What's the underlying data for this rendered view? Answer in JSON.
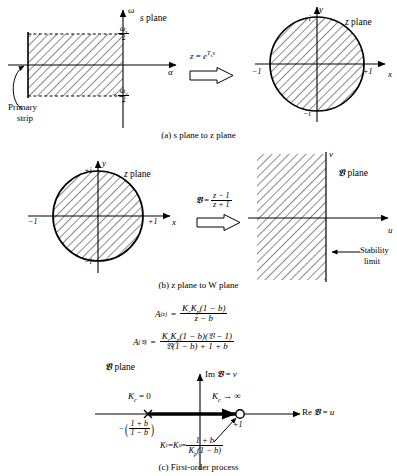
{
  "figure": {
    "captions": {
      "a": "(a)  s plane to z plane",
      "b": "(b)  z plane to W plane",
      "c": "(c)  First-order process"
    }
  },
  "panel_a": {
    "s_plane": {
      "plane_label": "s plane",
      "axis_vertical": "ω",
      "axis_horizontal": "α",
      "tick_upper_num": "ω",
      "tick_upper_sub": "s",
      "tick_upper_den": "2",
      "tick_lower_sign": "−",
      "tick_lower_num": "ω",
      "tick_lower_sub": "s",
      "tick_lower_den": "2",
      "annotation_line1": "Primary",
      "annotation_line2": "strip"
    },
    "transform": {
      "lhs": "z",
      "eq": "=",
      "base": "e",
      "exp_sub": "T",
      "exp_sub2": "s",
      "exp_var": "s"
    },
    "z_plane": {
      "plane_label": "z plane",
      "axis_vertical": "y",
      "axis_horizontal": "x",
      "tick_top": "+i",
      "tick_bottom": "−i",
      "tick_left": "−1",
      "tick_right": "+1"
    }
  },
  "panel_b": {
    "z_plane": {
      "plane_label": "z plane",
      "axis_vertical": "y",
      "axis_horizontal": "x",
      "tick_top": "+i",
      "tick_bottom": "−i",
      "tick_left": "−1",
      "tick_right": "+1"
    },
    "transform": {
      "lhs": "𝔙",
      "eq": "=",
      "num": "z − 1",
      "den": "z + 1"
    },
    "w_plane": {
      "plane_label": "𝔙 plane",
      "axis_vertical": "v",
      "axis_horizontal": "u",
      "stability_line1": "Stability",
      "stability_line2": "limit"
    }
  },
  "equations": {
    "eq1": {
      "lhs_var": "A",
      "lhs_sub": "(z)",
      "eq": "=",
      "num_k1": "K",
      "num_k1_sub": "c",
      "num_k2": "K",
      "num_k2_sub": "p",
      "num_rest": "(1 − b)",
      "den": "z − b"
    },
    "eq2": {
      "lhs_var": "A",
      "lhs_sub": "(𝔙)",
      "eq": "=",
      "num_k1": "K",
      "num_k1_sub": "c",
      "num_k2": "K",
      "num_k2_sub": "p",
      "num_rest": "(1 − b)(𝔙 − 1)",
      "den": "𝔙(1 − b) + 1 + b"
    }
  },
  "panel_c": {
    "plane_label": "𝔙 plane",
    "axis_vertical_label": "Im 𝔙 = v",
    "axis_horizontal_label": "Re 𝔙 = u",
    "kc_zero": "K",
    "kc_zero_sub": "c",
    "kc_zero_rest": " = 0",
    "kc_inf": "K",
    "kc_inf_sub": "c",
    "kc_inf_rest": " → ∞",
    "pole_value_sign": "−",
    "pole_value_num": "1 + b",
    "pole_value_den": "1 − b",
    "zero_label": "+1",
    "ku_lhs1": "K",
    "ku_lhs1_sub": "c",
    "ku_eq1": " = ",
    "ku_lhs2": "K",
    "ku_lhs2_sub": "u",
    "ku_eq2": " = ",
    "ku_num": "1 + b",
    "ku_den_k": "K",
    "ku_den_k_sub": "p",
    "ku_den_rest": "(1 − b)"
  },
  "style": {
    "ink": "#000000",
    "hatch": "#555555"
  }
}
